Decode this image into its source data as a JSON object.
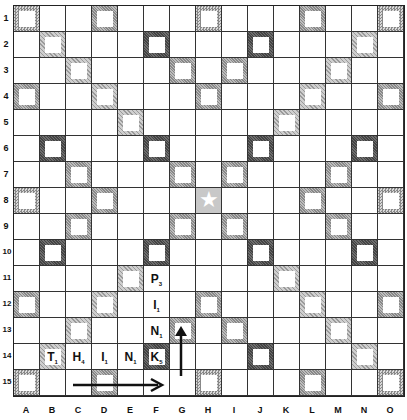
{
  "board": {
    "size": 15,
    "columns": [
      "A",
      "B",
      "C",
      "D",
      "E",
      "F",
      "G",
      "H",
      "I",
      "J",
      "K",
      "L",
      "M",
      "N",
      "O"
    ],
    "rows": [
      "1",
      "2",
      "3",
      "4",
      "5",
      "6",
      "7",
      "8",
      "9",
      "10",
      "11",
      "12",
      "13",
      "14",
      "15"
    ],
    "premium_legend": {
      "TW": "triple-word (dotted)",
      "DW": "double-word (light hatched)",
      "DL": "double-letter (hatched)",
      "TL": "triple-letter (dark)",
      "STAR": "center star"
    },
    "premium_squares": {
      "TW": [
        "A1",
        "H1",
        "O1",
        "A8",
        "O8",
        "A15",
        "H15",
        "O15"
      ],
      "DW": [
        "B2",
        "C3",
        "D4",
        "E5",
        "N2",
        "M3",
        "L4",
        "K5",
        "B14",
        "C13",
        "D12",
        "E11",
        "N14",
        "M13",
        "L12",
        "K11"
      ],
      "TL": [
        "F2",
        "J2",
        "B6",
        "F6",
        "J6",
        "N6",
        "B10",
        "F10",
        "J10",
        "N10",
        "F14",
        "J14"
      ],
      "DL": [
        "D1",
        "L1",
        "G3",
        "I3",
        "A4",
        "H4",
        "O4",
        "C7",
        "G7",
        "I7",
        "M7",
        "D8",
        "L8",
        "C9",
        "G9",
        "I9",
        "M9",
        "A12",
        "H12",
        "O12",
        "G13",
        "I13",
        "D15",
        "L15"
      ],
      "STAR": [
        "H8"
      ]
    },
    "tiles": [
      {
        "cell": "F11",
        "letter": "P",
        "points": "3"
      },
      {
        "cell": "F12",
        "letter": "I",
        "points": "1"
      },
      {
        "cell": "F13",
        "letter": "N",
        "points": "1"
      },
      {
        "cell": "B14",
        "letter": "T",
        "points": "1"
      },
      {
        "cell": "C14",
        "letter": "H",
        "points": "4"
      },
      {
        "cell": "D14",
        "letter": "I",
        "points": "1"
      },
      {
        "cell": "E14",
        "letter": "N",
        "points": "1"
      },
      {
        "cell": "F14",
        "letter": "K",
        "points": "5"
      }
    ],
    "arrows": [
      {
        "name": "horizontal-arrow",
        "direction": "right",
        "from": "C15",
        "to": "F15"
      },
      {
        "name": "vertical-arrow",
        "direction": "up",
        "from": "G14",
        "to": "G13"
      }
    ]
  }
}
